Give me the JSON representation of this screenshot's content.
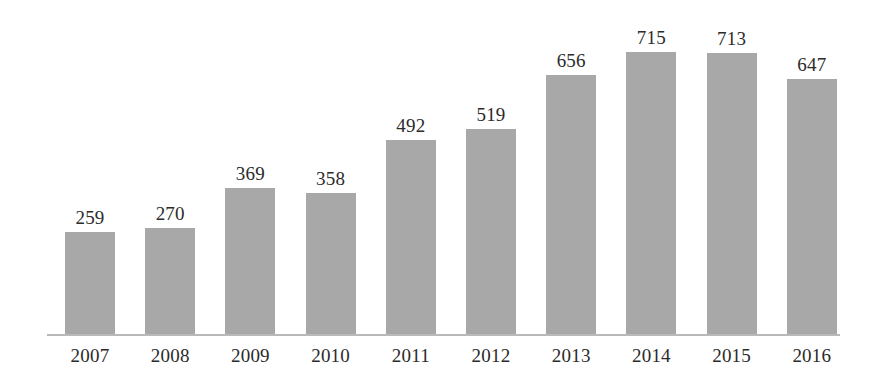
{
  "chart_data": {
    "type": "bar",
    "title": "",
    "subtitle": "",
    "xlabel": "",
    "ylabel": "",
    "categories": [
      "2007",
      "2008",
      "2009",
      "2010",
      "2011",
      "2012",
      "2013",
      "2014",
      "2015",
      "2016"
    ],
    "values": [
      259,
      270,
      369,
      358,
      492,
      519,
      656,
      715,
      713,
      647
    ],
    "value_labels": [
      "259",
      "270",
      "369",
      "358",
      "492",
      "519",
      "656",
      "715",
      "713",
      "647"
    ],
    "series": [
      {
        "name": "",
        "values": [
          259,
          270,
          369,
          358,
          492,
          519,
          656,
          715,
          713,
          647
        ]
      }
    ],
    "ylim": [
      0,
      760
    ],
    "grid": false,
    "legend": false,
    "legend_position": "none",
    "y_axis_visible": false,
    "x_axis_visible": true,
    "data_labels_shown": true,
    "bar_color": "#a8a8a8",
    "axis_color": "#b9b9b9",
    "label_color": "#2b2b2b",
    "background_color": "#ffffff"
  },
  "layout": {
    "baseline_y": 334,
    "axis_left": 47,
    "axis_right": 840,
    "bar_width": 50,
    "bar_pitch": 80.2,
    "first_bar_left": 65,
    "pixels_per_unit": 0.3944,
    "value_label_offset": 24,
    "tick_label_top": 346
  }
}
